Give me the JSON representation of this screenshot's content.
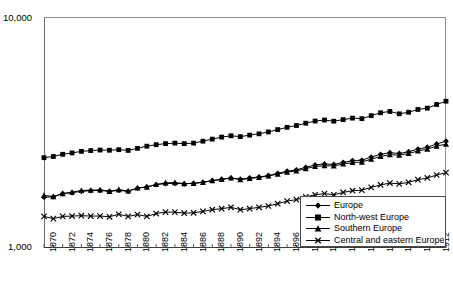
{
  "chart_data": {
    "type": "line",
    "title": "",
    "subtitle": "",
    "xlabel": "",
    "ylabel": "",
    "yscale": "log",
    "ylim": [
      1000,
      10000
    ],
    "ytick_labels": [
      "10,000",
      "1,000"
    ],
    "grid": false,
    "legend_position": "lower-right",
    "xlim": [
      1870,
      1913
    ],
    "x": [
      1870,
      1871,
      1872,
      1873,
      1874,
      1875,
      1876,
      1877,
      1878,
      1879,
      1880,
      1881,
      1882,
      1883,
      1884,
      1885,
      1886,
      1887,
      1888,
      1889,
      1890,
      1891,
      1892,
      1893,
      1894,
      1895,
      1896,
      1897,
      1898,
      1899,
      1900,
      1901,
      1902,
      1903,
      1904,
      1905,
      1906,
      1907,
      1908,
      1909,
      1910,
      1911,
      1912,
      1913
    ],
    "xtick_labels": [
      "1870",
      "1872",
      "1874",
      "1876",
      "1878",
      "1880",
      "1882",
      "1884",
      "1886",
      "1888",
      "1890",
      "1892",
      "1894",
      "1896",
      "1898",
      "1900",
      "1902",
      "1904",
      "1906",
      "1908",
      "1910",
      "1912"
    ],
    "series": [
      {
        "name": "Europe",
        "marker": "diamond",
        "values": [
          1660,
          1665,
          1720,
          1735,
          1760,
          1770,
          1775,
          1760,
          1775,
          1760,
          1815,
          1840,
          1880,
          1900,
          1905,
          1895,
          1905,
          1925,
          1960,
          1985,
          2010,
          1985,
          2010,
          2030,
          2060,
          2105,
          2150,
          2180,
          2235,
          2290,
          2310,
          2300,
          2345,
          2390,
          2400,
          2475,
          2545,
          2585,
          2565,
          2610,
          2680,
          2730,
          2820,
          2900
        ]
      },
      {
        "name": "North-west Europe",
        "marker": "square",
        "values": [
          2460,
          2490,
          2545,
          2580,
          2620,
          2640,
          2655,
          2650,
          2665,
          2645,
          2700,
          2760,
          2800,
          2830,
          2845,
          2830,
          2845,
          2900,
          2960,
          3020,
          3060,
          3035,
          3080,
          3120,
          3180,
          3255,
          3330,
          3390,
          3470,
          3545,
          3580,
          3540,
          3595,
          3650,
          3630,
          3740,
          3850,
          3900,
          3810,
          3870,
          3980,
          4030,
          4180,
          4320
        ]
      },
      {
        "name": "Southern Europe",
        "marker": "triangle",
        "values": [
          1690,
          1670,
          1720,
          1745,
          1775,
          1780,
          1785,
          1760,
          1790,
          1765,
          1820,
          1835,
          1885,
          1915,
          1920,
          1900,
          1905,
          1925,
          1955,
          1980,
          2010,
          1975,
          2000,
          2020,
          2050,
          2090,
          2130,
          2155,
          2205,
          2255,
          2270,
          2265,
          2310,
          2345,
          2355,
          2425,
          2490,
          2535,
          2525,
          2565,
          2630,
          2680,
          2760,
          2815
        ]
      },
      {
        "name": "Central and eastern Europe",
        "marker": "x",
        "values": [
          1370,
          1340,
          1370,
          1375,
          1380,
          1375,
          1375,
          1365,
          1400,
          1370,
          1395,
          1370,
          1410,
          1430,
          1430,
          1415,
          1420,
          1440,
          1465,
          1480,
          1500,
          1465,
          1480,
          1500,
          1520,
          1555,
          1595,
          1620,
          1665,
          1700,
          1720,
          1700,
          1740,
          1770,
          1780,
          1830,
          1875,
          1910,
          1895,
          1925,
          1975,
          2010,
          2070,
          2120
        ]
      }
    ]
  },
  "legend": {
    "items": [
      {
        "label": "Europe",
        "marker": "diamond"
      },
      {
        "label": "North-west Europe",
        "marker": "square"
      },
      {
        "label": "Southern Europe",
        "marker": "triangle"
      },
      {
        "label": "Central and eastern Europe",
        "marker": "x"
      }
    ]
  },
  "colors": {
    "series": "#000000",
    "axis": "#4a4a4a",
    "background": "#ffffff"
  }
}
